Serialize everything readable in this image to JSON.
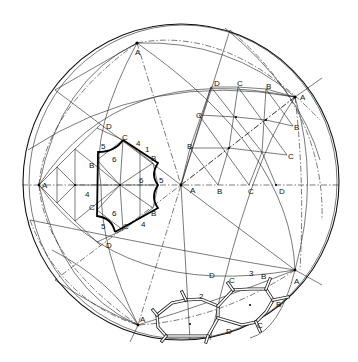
{
  "figure": {
    "type": "spherical-lattice-diagram",
    "colors": {
      "ink": "#111111",
      "background": "#ffffff"
    }
  },
  "vertices": {
    "A_top": {
      "label": "A",
      "x": 137,
      "y": 43
    },
    "A_left": {
      "label": "A",
      "x": 39,
      "y": 185
    },
    "A_center": {
      "label": "A",
      "x": 181,
      "y": 185
    },
    "A_right_top": {
      "label": "A",
      "x": 295,
      "y": 97
    },
    "A_right_bottom": {
      "label": "A",
      "x": 295,
      "y": 270
    },
    "A_bottom": {
      "label": "A",
      "x": 138,
      "y": 325
    }
  },
  "left_patch": {
    "labels": [
      {
        "text": "D",
        "x": 106,
        "y": 128
      },
      {
        "text": "C",
        "x": 123,
        "y": 140
      },
      {
        "text": "4",
        "x": 136,
        "y": 145
      },
      {
        "text": "1",
        "x": 145,
        "y": 151
      },
      {
        "text": "B",
        "x": 151,
        "y": 161
      },
      {
        "text": "5",
        "x": 100,
        "y": 148
      },
      {
        "text": "6",
        "x": 113,
        "y": 160
      },
      {
        "text": "B",
        "x": 89,
        "y": 168
      },
      {
        "text": "6",
        "x": 139,
        "y": 182
      },
      {
        "text": "5",
        "x": 161,
        "y": 182
      },
      {
        "text": "A",
        "x": 42,
        "y": 187
      },
      {
        "text": "4",
        "x": 85,
        "y": 196
      },
      {
        "text": "C",
        "x": 89,
        "y": 209
      },
      {
        "text": "6",
        "x": 113,
        "y": 215
      },
      {
        "text": "B",
        "x": 151,
        "y": 216
      },
      {
        "text": "5",
        "x": 100,
        "y": 228
      },
      {
        "text": "C",
        "x": 123,
        "y": 228
      },
      {
        "text": "4",
        "x": 141,
        "y": 226
      },
      {
        "text": "D",
        "x": 106,
        "y": 248
      }
    ]
  },
  "right_patch": {
    "labels": [
      {
        "text": "D",
        "x": 214,
        "y": 86
      },
      {
        "text": "C",
        "x": 238,
        "y": 86
      },
      {
        "text": "B",
        "x": 267,
        "y": 89
      },
      {
        "text": "A",
        "x": 302,
        "y": 99
      },
      {
        "text": "C",
        "x": 197,
        "y": 117
      },
      {
        "text": "B",
        "x": 295,
        "y": 129
      },
      {
        "text": "B",
        "x": 187,
        "y": 148
      },
      {
        "text": "C",
        "x": 289,
        "y": 159
      },
      {
        "text": "A",
        "x": 190,
        "y": 193
      },
      {
        "text": "B",
        "x": 218,
        "y": 193
      },
      {
        "text": "C",
        "x": 249,
        "y": 193
      },
      {
        "text": "D",
        "x": 280,
        "y": 193
      }
    ]
  },
  "molecule": {
    "labels": [
      {
        "text": "D",
        "x": 209,
        "y": 278
      },
      {
        "text": "C",
        "x": 230,
        "y": 282
      },
      {
        "text": "3",
        "x": 249,
        "y": 276
      },
      {
        "text": "B",
        "x": 262,
        "y": 278
      },
      {
        "text": "A",
        "x": 295,
        "y": 284
      },
      {
        "text": "2",
        "x": 199,
        "y": 299
      },
      {
        "text": "B",
        "x": 276,
        "y": 306
      },
      {
        "text": "A",
        "x": 141,
        "y": 321
      },
      {
        "text": "C",
        "x": 257,
        "y": 327
      },
      {
        "text": "D",
        "x": 227,
        "y": 333
      }
    ]
  }
}
